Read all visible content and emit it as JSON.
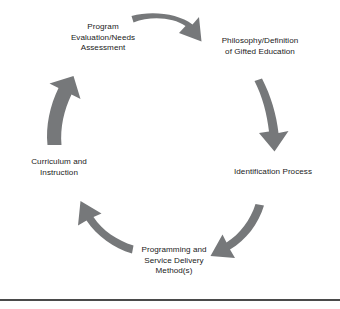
{
  "figure": {
    "type": "cycle-diagram",
    "background_color": "#ffffff",
    "arrow_color": "#76787a",
    "text_color": "#1a1a1a",
    "rule_color": "#4a4a4a",
    "direction": "clockwise"
  },
  "nodes": [
    {
      "id": "evaluation",
      "position": "top-left",
      "label": "Program\nEvaluation/Needs\nAssessment"
    },
    {
      "id": "philosophy",
      "position": "top-right",
      "label": "Philosophy/Definition\nof Gifted Education"
    },
    {
      "id": "identification",
      "position": "right",
      "label": "Identification Process"
    },
    {
      "id": "programming",
      "position": "bottom",
      "label": "Programming and\nService Delivery\nMethod(s)"
    },
    {
      "id": "curriculum",
      "position": "left",
      "label": "Curriculum and\nInstruction"
    }
  ],
  "arrows": [
    {
      "id": "arrow-top",
      "from": "evaluation",
      "to": "philosophy"
    },
    {
      "id": "arrow-right",
      "from": "philosophy",
      "to": "identification"
    },
    {
      "id": "arrow-bottom-right",
      "from": "identification",
      "to": "programming"
    },
    {
      "id": "arrow-bottom-left",
      "from": "programming",
      "to": "curriculum"
    },
    {
      "id": "arrow-left",
      "from": "curriculum",
      "to": "evaluation"
    }
  ]
}
